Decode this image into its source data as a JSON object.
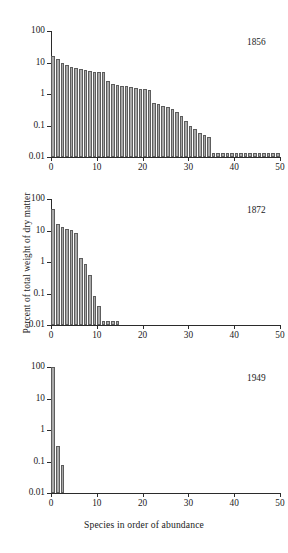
{
  "figure": {
    "y_axis_label": "Percent of total weight of dry matter",
    "x_axis_label": "Species in order of abundance"
  },
  "chart_data": [
    {
      "type": "bar",
      "title": "1856",
      "xlabel": "Species in order of abundance",
      "ylabel": "Percent of total weight of dry matter",
      "yscale": "log",
      "ylim": [
        0.01,
        100
      ],
      "ytick_labels": [
        "100",
        "10",
        "1",
        "0.1",
        "0.01"
      ],
      "ytick_values": [
        100,
        10,
        1,
        0.1,
        0.01
      ],
      "xlim": [
        0,
        50
      ],
      "xtick_labels": [
        "0",
        "10",
        "20",
        "30",
        "40",
        "50"
      ],
      "xtick_values": [
        0,
        10,
        20,
        30,
        40,
        50
      ],
      "grid": false,
      "legend": "none",
      "annotation": "1856",
      "annotation_position": "top-right",
      "x": [
        1,
        2,
        3,
        4,
        5,
        6,
        7,
        8,
        9,
        10,
        11,
        12,
        13,
        14,
        15,
        16,
        17,
        18,
        19,
        20,
        21,
        22,
        23,
        24,
        25,
        26,
        27,
        28,
        29,
        30,
        31,
        32,
        33,
        34,
        35,
        36,
        37,
        38,
        39,
        40,
        41,
        42,
        43,
        44,
        45,
        46,
        47,
        48,
        49,
        50
      ],
      "values": [
        16,
        13,
        9.5,
        8.2,
        7.3,
        6.6,
        6.1,
        5.6,
        5.2,
        5.0,
        5.0,
        5.0,
        2.6,
        2.1,
        1.9,
        1.8,
        1.75,
        1.7,
        1.6,
        1.45,
        1.4,
        1.35,
        0.52,
        0.47,
        0.43,
        0.4,
        0.33,
        0.26,
        0.2,
        0.135,
        0.1,
        0.075,
        0.06,
        0.05,
        0.044,
        0.013,
        0.013,
        0.013,
        0.013,
        0.013,
        0.013,
        0.013,
        0.013,
        0.013,
        0.013,
        0.013,
        0.013,
        0.013,
        0.013,
        0.013
      ]
    },
    {
      "type": "bar",
      "title": "1872",
      "xlabel": "Species in order of abundance",
      "ylabel": "Percent of total weight of dry matter",
      "yscale": "log",
      "ylim": [
        0.01,
        100
      ],
      "ytick_labels": [
        "100",
        "10",
        "1",
        "0.1",
        "0.01"
      ],
      "ytick_values": [
        100,
        10,
        1,
        0.1,
        0.01
      ],
      "xlim": [
        0,
        50
      ],
      "xtick_labels": [
        "0",
        "10",
        "20",
        "30",
        "40",
        "50"
      ],
      "xtick_values": [
        0,
        10,
        20,
        30,
        40,
        50
      ],
      "grid": false,
      "legend": "none",
      "annotation": "1872",
      "annotation_position": "top-right",
      "x": [
        1,
        2,
        3,
        4,
        5,
        6,
        7,
        8,
        9,
        10,
        11,
        12,
        13,
        14,
        15
      ],
      "values": [
        47,
        16,
        13,
        11,
        10.5,
        8.5,
        1.3,
        0.85,
        0.4,
        0.082,
        0.04,
        0.013,
        0.013,
        0.013,
        0.013
      ]
    },
    {
      "type": "bar",
      "title": "1949",
      "xlabel": "Species in order of abundance",
      "ylabel": "Percent of total weight of dry matter",
      "yscale": "log",
      "ylim": [
        0.01,
        100
      ],
      "ytick_labels": [
        "100",
        "10",
        "1",
        "0.1",
        "0.01"
      ],
      "ytick_values": [
        100,
        10,
        1,
        0.1,
        0.01
      ],
      "xlim": [
        0,
        50
      ],
      "xtick_labels": [
        "0",
        "10",
        "20",
        "30",
        "40",
        "50"
      ],
      "xtick_values": [
        0,
        10,
        20,
        30,
        40,
        50
      ],
      "grid": false,
      "legend": "none",
      "annotation": "1949",
      "annotation_position": "top-right",
      "x": [
        1,
        2,
        3
      ],
      "values": [
        100,
        0.3,
        0.075
      ]
    }
  ],
  "style": {
    "bar_fill": "#a9a9a9",
    "bar_edge": "#5d5d5d",
    "axis_color": "#2b2b2b",
    "background": "#ffffff"
  }
}
